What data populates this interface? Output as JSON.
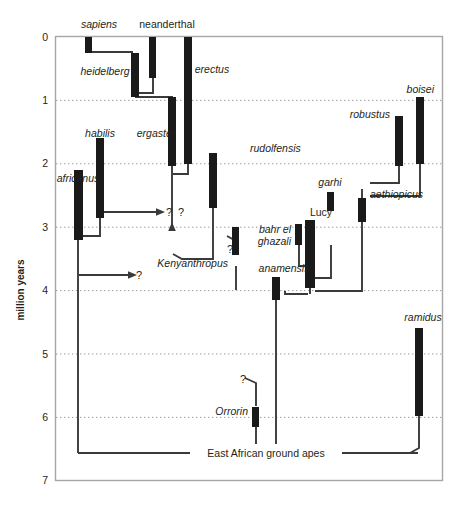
{
  "figure": {
    "kind": "hominin-phylogeny-cladogram",
    "axis": {
      "title": "million years",
      "ticks": [
        "0",
        "1",
        "2",
        "3",
        "4",
        "5",
        "6",
        "7"
      ],
      "min": 0,
      "max": 7,
      "gridline_style": "dotted",
      "gridlines_at": [
        1,
        2,
        3,
        4,
        5,
        6
      ]
    },
    "root_label": "East African ground apes",
    "colors": {
      "bar": "#1a1a1a",
      "line": "#3a3a3a",
      "frame": "#a6a6a6",
      "grid": "#9a9a9a",
      "text": "#231f20",
      "background": "#ffffff"
    },
    "uncertainty_markers": [
      {
        "id": "q-africanus-arrow",
        "label": "?"
      },
      {
        "id": "q-ergaster-stem",
        "label": "?"
      },
      {
        "id": "q-kenyanthropus",
        "label": "?"
      },
      {
        "id": "q-deep-arrow",
        "label": "?"
      },
      {
        "id": "q-orrorin",
        "label": "?"
      }
    ],
    "taxa": [
      {
        "name": "sapiens",
        "style": "italic",
        "range_ma": [
          0.0,
          0.25
        ]
      },
      {
        "name": "neanderthal",
        "style": "roman",
        "range_ma": [
          0.0,
          0.65
        ]
      },
      {
        "name": "erectus",
        "style": "italic",
        "range_ma": [
          0.0,
          2.0
        ]
      },
      {
        "name": "heidelberg",
        "style": "italic",
        "range_ma": [
          0.25,
          0.95
        ]
      },
      {
        "name": "ergaster",
        "style": "italic",
        "range_ma": [
          0.95,
          2.0
        ]
      },
      {
        "name": "habilis",
        "style": "italic",
        "range_ma": [
          1.6,
          2.45
        ]
      },
      {
        "name": "rudolfensis",
        "style": "italic",
        "range_ma": [
          1.85,
          2.6
        ]
      },
      {
        "name": "africanus",
        "style": "italic",
        "range_ma": [
          2.1,
          3.35
        ]
      },
      {
        "name": "boisei",
        "style": "italic",
        "range_ma": [
          0.95,
          2.05
        ]
      },
      {
        "name": "robustus",
        "style": "italic",
        "range_ma": [
          1.25,
          2.05
        ]
      },
      {
        "name": "aethiopicus",
        "style": "italic",
        "range_ma": [
          2.55,
          2.95
        ]
      },
      {
        "name": "garhi",
        "style": "italic",
        "range_ma": [
          2.45,
          2.75
        ]
      },
      {
        "name": "Lucy",
        "style": "roman",
        "range_ma": [
          2.9,
          3.85
        ]
      },
      {
        "name": "bahr el",
        "style": "italic",
        "range_ma": [
          2.95,
          3.3
        ]
      },
      {
        "name": "ghazali",
        "style": "italic",
        "range_ma": [
          2.95,
          3.3
        ]
      },
      {
        "name": "Kenyanthropus",
        "style": "italic",
        "range_ma": [
          3.0,
          3.45
        ]
      },
      {
        "name": "anamensis",
        "style": "italic",
        "range_ma": [
          3.8,
          4.2
        ]
      },
      {
        "name": "ramidus",
        "style": "italic",
        "range_ma": [
          4.6,
          5.95
        ]
      },
      {
        "name": "Orrorin",
        "style": "italic",
        "range_ma": [
          5.85,
          6.15
        ]
      }
    ]
  }
}
